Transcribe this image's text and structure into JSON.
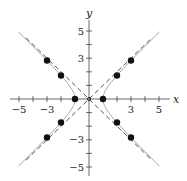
{
  "chart_data": {
    "type": "scatter",
    "title": "",
    "xlabel": "x",
    "ylabel": "y",
    "xlim": [
      -5.5,
      5.5
    ],
    "ylim": [
      -5.5,
      5.5
    ],
    "x_ticks": [
      -5,
      -4,
      -3,
      -2,
      -1,
      1,
      2,
      3,
      4,
      5
    ],
    "x_tick_labels": [
      "-5",
      "-3",
      "3",
      "5"
    ],
    "y_ticks": [
      -5,
      -4,
      -3,
      -2,
      -1,
      1,
      2,
      3,
      4,
      5
    ],
    "y_tick_labels": [
      "5",
      "3",
      "-3",
      "-5"
    ],
    "grid": false,
    "series": [
      {
        "name": "hyperbola x^2 - y^2 = 1",
        "type": "line",
        "style": "solid-gray"
      },
      {
        "name": "asymptote y = x",
        "type": "line",
        "style": "dashed",
        "x": [
          -4.5,
          4.5
        ],
        "y": [
          -4.5,
          4.5
        ]
      },
      {
        "name": "asymptote y = -x",
        "type": "line",
        "style": "dashed",
        "x": [
          -4.5,
          4.5
        ],
        "y": [
          4.5,
          -4.5
        ]
      },
      {
        "name": "points",
        "type": "scatter",
        "points": [
          {
            "x": -3,
            "y": 2.83
          },
          {
            "x": -2,
            "y": 1.73
          },
          {
            "x": -1,
            "y": 0
          },
          {
            "x": -2,
            "y": -1.73
          },
          {
            "x": -3,
            "y": -2.83
          },
          {
            "x": 1,
            "y": 0
          },
          {
            "x": 2,
            "y": 1.73
          },
          {
            "x": 3,
            "y": 2.83
          },
          {
            "x": 2,
            "y": -1.73
          },
          {
            "x": 3,
            "y": -2.83
          }
        ]
      },
      {
        "name": "center",
        "type": "scatter",
        "points": [
          {
            "x": 0,
            "y": 0
          }
        ]
      }
    ]
  }
}
